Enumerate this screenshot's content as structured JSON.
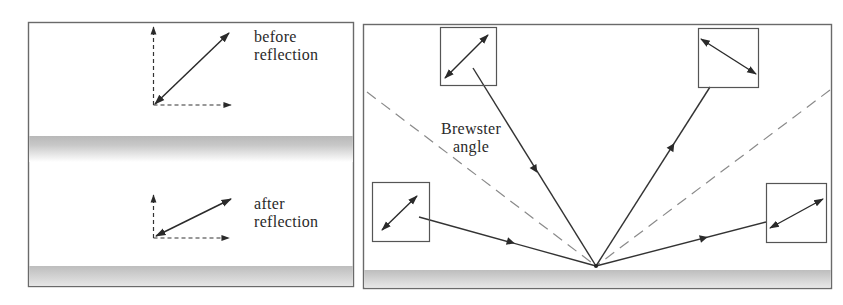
{
  "figure": {
    "colors": {
      "background": "#ffffff",
      "frame": "#6a6a6a",
      "ray": "#333333",
      "dashed": "#8a8a8a",
      "surface_dark": "#b4b4b4",
      "surface_light": "#f4f4f4"
    }
  },
  "left_panel": {
    "top_diagram": {
      "label_line1": "before",
      "label_line2": "reflection"
    },
    "bottom_diagram": {
      "label_line1": "after",
      "label_line2": "reflection"
    }
  },
  "right_panel": {
    "brewster_label_line1": "Brewster",
    "brewster_label_line2": "angle",
    "boxes": [
      {
        "position": "top-left",
        "polarization": "diagonal-up-right",
        "ray": "incident"
      },
      {
        "position": "top-right",
        "polarization": "diagonal-down-right",
        "ray": "reflected"
      },
      {
        "position": "bottom-left",
        "polarization": "diagonal-up-right",
        "ray": "incident"
      },
      {
        "position": "bottom-right",
        "polarization": "diagonal-up-right",
        "ray": "reflected"
      }
    ]
  }
}
